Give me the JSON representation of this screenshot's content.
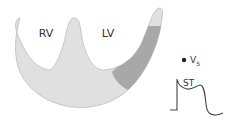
{
  "labels": {
    "rv": "RV",
    "lv": "LV",
    "lead": "V",
    "lead_sub": "5",
    "segment": "ST"
  },
  "colors": {
    "myocardium_fill": "#e0e0e0",
    "myocardium_stroke": "#bdbdbd",
    "infarct_fill": "#a8a8a8",
    "text": "#333333",
    "ecg_stroke": "#444444"
  }
}
